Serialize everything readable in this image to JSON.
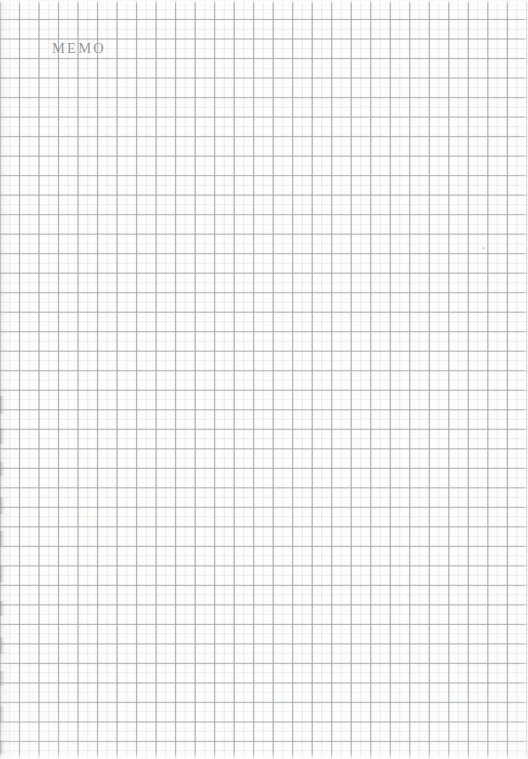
{
  "page": {
    "kind": "scanned-grid-memo-paper",
    "width": 528,
    "height": 759,
    "paper_color": "#fdfdfc"
  },
  "header": {
    "title": "MEMO",
    "color": "#9a9a9e"
  },
  "grid": {
    "minor_spacing_px": 9.76,
    "major_spacing_px": 19.52,
    "minor_color": "#bac0c6",
    "major_color": "#969ea6"
  },
  "artifacts": {
    "left_edge_shadow": true,
    "edge_marks": [
      {
        "top": 396,
        "height": 18
      },
      {
        "top": 428,
        "height": 16
      },
      {
        "top": 462,
        "height": 14
      },
      {
        "top": 497,
        "height": 17
      },
      {
        "top": 531,
        "height": 15
      },
      {
        "top": 566,
        "height": 16
      },
      {
        "top": 601,
        "height": 15
      },
      {
        "top": 637,
        "height": 17
      },
      {
        "top": 671,
        "height": 15
      },
      {
        "top": 706,
        "height": 16
      },
      {
        "top": 740,
        "height": 14
      }
    ],
    "specks": [
      {
        "left": 482,
        "top": 247
      }
    ]
  },
  "notes": {
    "body_text": "",
    "ruled_area_label": "blank grid writing area"
  }
}
